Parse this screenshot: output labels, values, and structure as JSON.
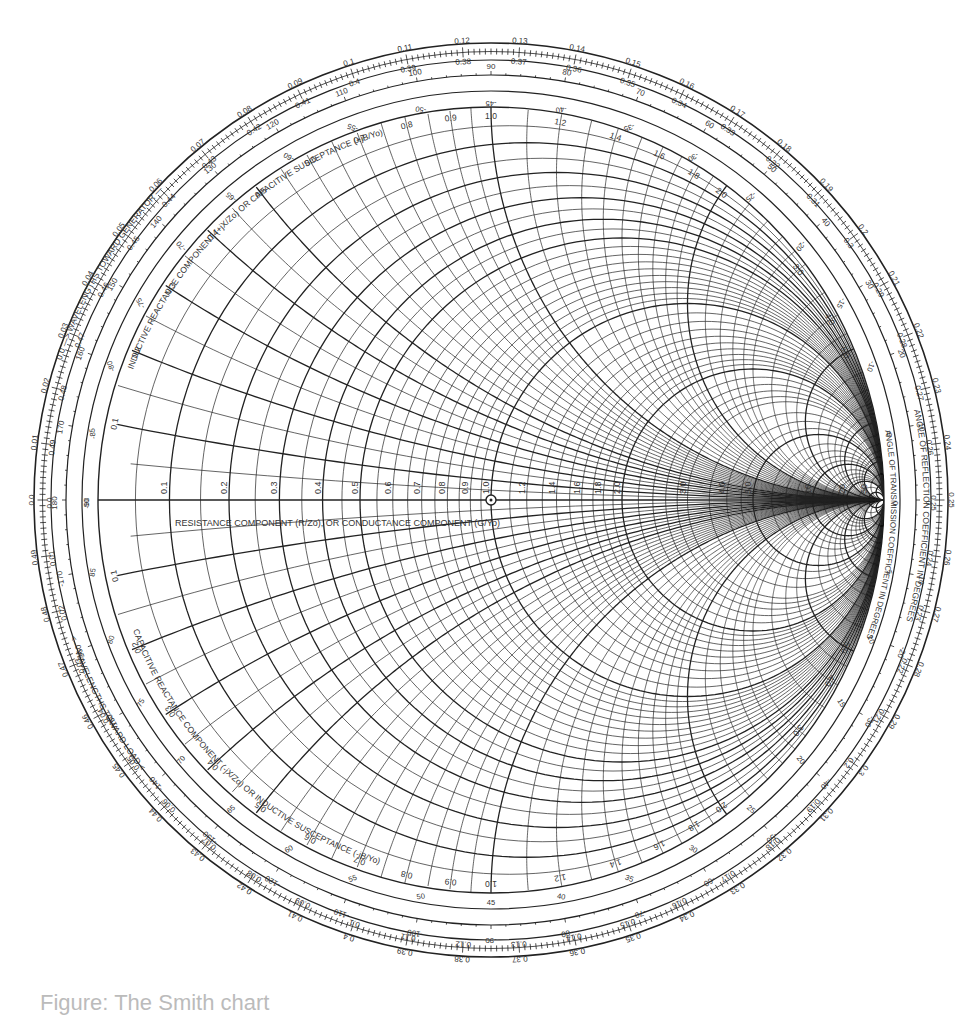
{
  "chart_data": {
    "type": "smith_chart",
    "title": "",
    "center_marker": "normalized impedance 1.0 (center)",
    "horizontal_axis_label": "RESISTANCE COMPONENT (R/Zo), OR CONDUCTANCE COMPONENT (G/Yo)",
    "upper_label": "INDUCTIVE REACTANCE COMPONENT (+jX/Zo) OR CAPACITIVE SUSCEPTANCE (+jB/Yo)",
    "lower_label": "CAPACITIVE REACTANCE COMPONENT (-jX/Zo) OR INDUCTIVE SUSCEPTANCE (-jB/Yo)",
    "ring_labels": {
      "wavelengths_toward_generator": "0.0 —> WAVELENGTHS TOWARD GENERATOR —>",
      "wavelengths_toward_load": "<— WAVELENGTHS TOWARD LOAD <—",
      "angle_reflection": "ANGLE OF REFLECTION COEFFICIENT IN DEGREES",
      "angle_transmission": "ANGLE OF TRANSMISSION COEFFICIENT IN DEGREES"
    },
    "resistance_circles": [
      0.1,
      0.2,
      0.3,
      0.4,
      0.5,
      0.6,
      0.7,
      0.8,
      0.9,
      1.0,
      1.2,
      1.4,
      1.6,
      1.8,
      2.0,
      3.0,
      4.0,
      5.0,
      10,
      20,
      50
    ],
    "reactance_arcs": [
      0.1,
      0.2,
      0.3,
      0.4,
      0.5,
      0.6,
      0.7,
      0.8,
      0.9,
      1.0,
      1.2,
      1.4,
      1.6,
      1.8,
      2.0,
      3.0,
      4.0,
      5.0,
      10,
      20,
      50
    ],
    "wavelength_toward_generator_ticks": [
      0.0,
      0.01,
      0.02,
      0.03,
      0.04,
      0.05,
      0.06,
      0.07,
      0.08,
      0.09,
      0.1,
      0.11,
      0.12,
      0.13,
      0.14,
      0.15,
      0.16,
      0.17,
      0.18,
      0.19,
      0.2,
      0.21,
      0.22,
      0.23,
      0.24,
      0.25,
      0.26,
      0.27,
      0.28,
      0.29,
      0.3,
      0.31,
      0.32,
      0.33,
      0.34,
      0.35,
      0.36,
      0.37,
      0.38,
      0.39,
      0.4,
      0.41,
      0.42,
      0.43,
      0.44,
      0.45,
      0.46,
      0.47,
      0.48,
      0.49
    ],
    "reflection_angle_ticks": [
      180,
      170,
      160,
      150,
      140,
      130,
      120,
      110,
      100,
      90,
      80,
      70,
      60,
      50,
      40,
      30,
      20,
      10,
      0,
      -10,
      -20,
      -30,
      -40,
      -50,
      -60,
      -70,
      -80,
      -90,
      -100,
      -110,
      -120,
      -130,
      -140,
      -150,
      -160,
      -170
    ],
    "transmission_angle_ticks": [
      90,
      85,
      80,
      75,
      70,
      65,
      60,
      55,
      50,
      45,
      40,
      35,
      30,
      25,
      20,
      15,
      10,
      5,
      0,
      -5,
      -10,
      -15,
      -20,
      -25,
      -30,
      -35,
      -40,
      -45,
      -50,
      -55,
      -60,
      -65,
      -70,
      -75,
      -80,
      -85,
      -90
    ],
    "geometry": {
      "cx": 491,
      "cy": 500,
      "r_chart": 393,
      "r_trans": 409,
      "r_refl": 425,
      "r_wl_inner": 440,
      "r_outer": 457
    }
  },
  "caption": "Figure: The Smith chart"
}
